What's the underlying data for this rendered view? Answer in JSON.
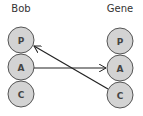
{
  "columns": [
    {
      "label": "Bob",
      "center_x": 21,
      "nodes": [
        {
          "label": "P",
          "cy": 40
        },
        {
          "label": "A",
          "cy": 67
        },
        {
          "label": "C",
          "cy": 94
        }
      ]
    },
    {
      "label": "Gene",
      "center_x": 120,
      "nodes": [
        {
          "label": "P",
          "cy": 41
        },
        {
          "label": "A",
          "cy": 68
        },
        {
          "label": "C",
          "cy": 95
        }
      ]
    }
  ],
  "arrows": [
    {
      "from": "Bob.A",
      "to": "Gene.A"
    },
    {
      "from": "Gene.C",
      "to": "Bob.P"
    }
  ],
  "colors": {
    "node_fill": "#d3d3d3",
    "node_stroke": "#555555",
    "arrow": "#222222",
    "label_text": "#333333"
  }
}
